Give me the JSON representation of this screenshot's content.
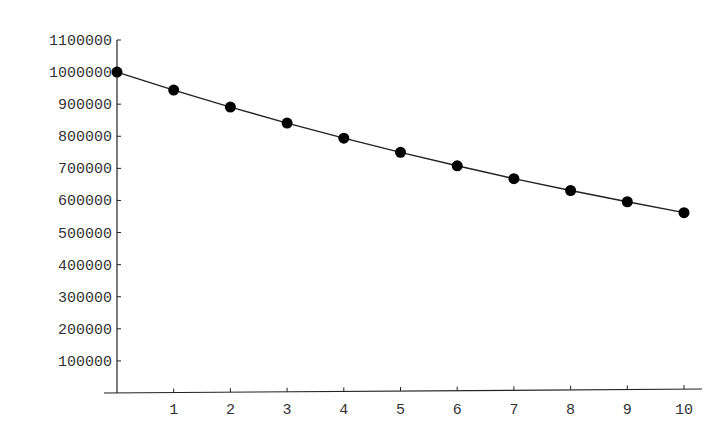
{
  "chart_data": {
    "type": "line",
    "title": "",
    "xlabel": "",
    "ylabel": "",
    "x": [
      0,
      1,
      2,
      3,
      4,
      5,
      6,
      7,
      8,
      9,
      10
    ],
    "series": [
      {
        "name": "value",
        "values": [
          1000000,
          944000,
          891000,
          841000,
          794000,
          750000,
          708000,
          668000,
          631000,
          596000,
          562000
        ],
        "markers": true,
        "color": "#000000"
      }
    ],
    "xticks": [
      "1",
      "2",
      "3",
      "4",
      "5",
      "6",
      "7",
      "8",
      "9",
      "10"
    ],
    "yticks": [
      "100000",
      "200000",
      "300000",
      "400000",
      "500000",
      "600000",
      "700000",
      "800000",
      "900000",
      "1000000",
      "1100000"
    ],
    "xlim": [
      0,
      10
    ],
    "ylim": [
      0,
      1100000
    ],
    "grid": false,
    "legend": null
  }
}
